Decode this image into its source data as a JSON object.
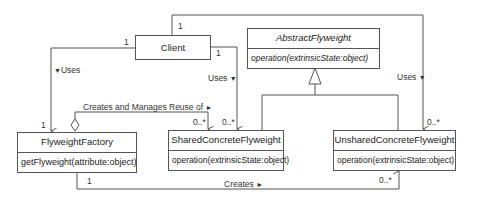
{
  "diagram": {
    "type": "UML class diagram",
    "classes": [
      {
        "id": "client",
        "name": "Client"
      },
      {
        "id": "abstract",
        "name": "AbstractFlyweight",
        "operation": "operation(extrinsicState:object)",
        "abstract": true
      },
      {
        "id": "factory",
        "name": "FlyweightFactory",
        "operation": "getFlyweight(attribute:object)"
      },
      {
        "id": "shared",
        "name": "SharedConcreteFlyweight",
        "operation": "operation(extrinsicState:object)"
      },
      {
        "id": "unshared",
        "name": "UnsharedConcreteFlyweight",
        "operation": "operation(extrinsicState:object)"
      }
    ],
    "relations": {
      "client_factory": {
        "label": "Uses",
        "mult_client": "1",
        "mult_target": "1"
      },
      "client_shared": {
        "label": "Uses",
        "mult_client": "1",
        "mult_target": "0..*"
      },
      "client_unshared": {
        "label": "Uses",
        "mult_client": "1",
        "mult_target": "0..*"
      },
      "factory_shared": {
        "label": "Creates and Manages Reuse of",
        "mult_target": "0..*"
      },
      "factory_unshared": {
        "label": "Creates",
        "mult_factory": "1",
        "mult_target": "0..*"
      }
    },
    "arrow_glyphs": {
      "down": "▼",
      "right": "►"
    }
  }
}
